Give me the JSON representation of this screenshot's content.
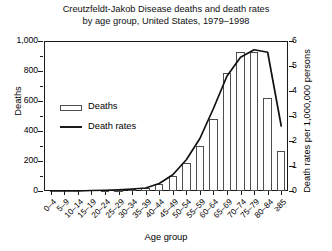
{
  "chart_data": {
    "type": "bar",
    "title": "Creutzfeldt-Jakob Disease deaths and death rates by age group, United States, 1979–1998",
    "title_line1": "Creutzfeldt-Jakob Disease deaths and death rates",
    "title_line2": "by age group, United States, 1979–1998",
    "xlabel": "Age group",
    "ylabel": "Deaths",
    "ylabel_right": "Death rates per 1,000,000 persons",
    "categories": [
      "0–4",
      "5–9",
      "10–14",
      "15–19",
      "20–24",
      "25–29",
      "30–34",
      "35–39",
      "40–44",
      "45–49",
      "50–54",
      "55–59",
      "60–64",
      "65–69",
      "70–74",
      "75–79",
      "80–84",
      "≥85"
    ],
    "ylim": [
      0,
      1000
    ],
    "yticks": [
      "0",
      "200",
      "400",
      "600",
      "800",
      "1,000"
    ],
    "ytick_values": [
      0,
      200,
      400,
      600,
      800,
      1000
    ],
    "ylim_right": [
      0,
      6
    ],
    "yticks_right": [
      "0",
      "1",
      "2",
      "3",
      "4",
      "5",
      "6"
    ],
    "ytick_values_right": [
      0,
      1,
      2,
      3,
      4,
      5,
      6
    ],
    "grid": false,
    "legend_position": "upper left",
    "series": [
      {
        "name": "Deaths",
        "type": "bar",
        "axis": "left",
        "values": [
          0,
          0,
          0,
          3,
          5,
          8,
          12,
          20,
          45,
          100,
          190,
          300,
          480,
          790,
          930,
          930,
          620,
          270
        ]
      },
      {
        "name": "Death rates",
        "type": "line",
        "axis": "right",
        "values": [
          0.0,
          0.0,
          0.0,
          0.02,
          0.03,
          0.05,
          0.08,
          0.12,
          0.3,
          0.65,
          1.25,
          2.1,
          3.3,
          4.6,
          5.35,
          5.65,
          5.55,
          2.6
        ]
      }
    ]
  },
  "legend": {
    "deaths_label": "Deaths",
    "rates_label": "Death rates"
  }
}
